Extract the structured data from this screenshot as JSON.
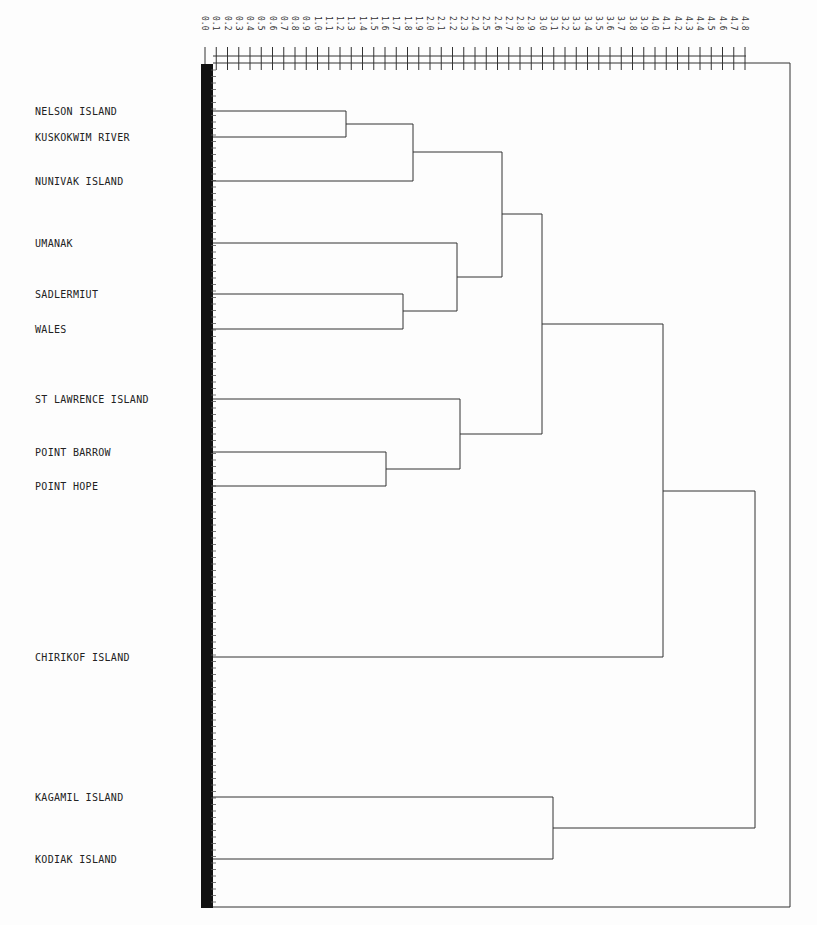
{
  "chart_data": {
    "type": "dendrogram",
    "title": "",
    "orientation": "horizontal (root at right)",
    "xlabel": "",
    "ylabel": "",
    "x_axis": {
      "position": "top",
      "range": [
        0.0,
        4.8
      ],
      "tick_step": 0.1,
      "tick_labels_rotated": true,
      "tick_labels": [
        "0.0",
        "0.1",
        "0.2",
        "0.3",
        "0.4",
        "0.5",
        "0.6",
        "0.7",
        "0.8",
        "0.9",
        "1.0",
        "1.1",
        "1.2",
        "1.3",
        "1.4",
        "1.5",
        "1.6",
        "1.7",
        "1.8",
        "1.9",
        "2.0",
        "2.1",
        "2.2",
        "2.3",
        "2.4",
        "2.5",
        "2.6",
        "2.7",
        "2.8",
        "2.9",
        "3.0",
        "3.1",
        "3.2",
        "3.3",
        "3.4",
        "3.5",
        "3.6",
        "3.7",
        "3.8",
        "3.9",
        "4.0",
        "4.1",
        "4.2",
        "4.3",
        "4.4",
        "4.5",
        "4.6",
        "4.7",
        "4.8"
      ]
    },
    "leaves": [
      {
        "id": 0,
        "label": "NELSON ISLAND",
        "y": 111
      },
      {
        "id": 1,
        "label": "KUSKOKWIM RIVER",
        "y": 137
      },
      {
        "id": 2,
        "label": "NUNIVAK ISLAND",
        "y": 181
      },
      {
        "id": 3,
        "label": "UMANAK",
        "y": 243
      },
      {
        "id": 4,
        "label": "SADLERMIUT",
        "y": 294
      },
      {
        "id": 5,
        "label": "WALES",
        "y": 329
      },
      {
        "id": 6,
        "label": "ST LAWRENCE ISLAND",
        "y": 399
      },
      {
        "id": 7,
        "label": "POINT BARROW",
        "y": 452
      },
      {
        "id": 8,
        "label": "POINT HOPE",
        "y": 486
      },
      {
        "id": 9,
        "label": "CHIRIKOF ISLAND",
        "y": 657
      },
      {
        "id": 10,
        "label": "KAGAMIL ISLAND",
        "y": 797
      },
      {
        "id": 11,
        "label": "KODIAK ISLAND",
        "y": 859
      }
    ],
    "merges": [
      {
        "members": [
          "NELSON ISLAND",
          "KUSKOKWIM RIVER"
        ],
        "height": 1.2
      },
      {
        "members": [
          "SADLERMIUT",
          "WALES"
        ],
        "height": 1.7
      },
      {
        "members": [
          "POINT BARROW",
          "POINT HOPE"
        ],
        "height": 1.5
      },
      {
        "members": [
          "NELSON/KUSKOKWIM",
          "NUNIVAK ISLAND"
        ],
        "height": 1.8
      },
      {
        "members": [
          "UMANAK",
          "SADLERMIUT/WALES"
        ],
        "height": 2.2
      },
      {
        "members": [
          "ST LAWRENCE ISLAND",
          "POINT BARROW/HOPE"
        ],
        "height": 2.2
      },
      {
        "members": [
          "NELSON..NUNIVAK",
          "UMANAK..WALES"
        ],
        "height": 2.6
      },
      {
        "members": [
          "NELSON..WALES",
          "ST LAWRENCE..POINT HOPE"
        ],
        "height": 3.0
      },
      {
        "members": [
          "KAGAMIL ISLAND",
          "KODIAK ISLAND"
        ],
        "height": 3.1
      },
      {
        "members": [
          "NORTHERN GROUP",
          "CHIRIKOF ISLAND"
        ],
        "height": 4.1
      },
      {
        "members": [
          "NORTHERN+CHIRIKOF",
          "KAGAMIL/KODIAK"
        ],
        "height": 4.9
      }
    ],
    "grid": false,
    "legend": null
  },
  "labels": {
    "leaf_0": "NELSON ISLAND",
    "leaf_1": "KUSKOKWIM RIVER",
    "leaf_2": "NUNIVAK ISLAND",
    "leaf_3": "UMANAK",
    "leaf_4": "SADLERMIUT",
    "leaf_5": "WALES",
    "leaf_6": "ST LAWRENCE ISLAND",
    "leaf_7": "POINT BARROW",
    "leaf_8": "POINT HOPE",
    "leaf_9": "CHIRIKOF ISLAND",
    "leaf_10": "KAGAMIL ISLAND",
    "leaf_11": "KODIAK ISLAND"
  },
  "colors": {
    "line": "#333333",
    "text": "#222222",
    "background": "#fdfdfd",
    "axis_bar": "#111111"
  }
}
